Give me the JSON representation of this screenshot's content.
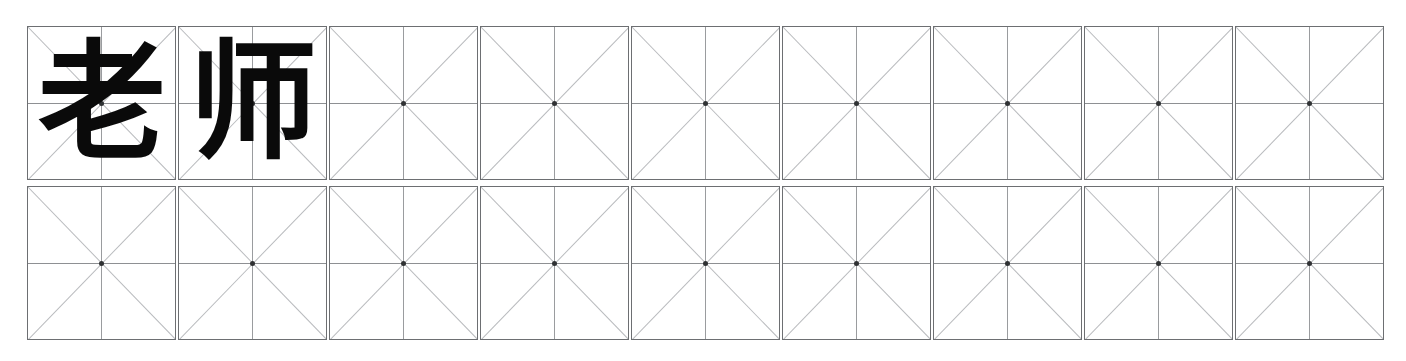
{
  "worksheet": {
    "title": "Chinese character handwriting practice sheet",
    "grid_style": "mi-zi-ge",
    "rows": 2,
    "columns": 9,
    "colors": {
      "page_background": "#ffffff",
      "cell_background": "#ffffff",
      "cell_border": "#6d6f72",
      "center_line": "#8e9093",
      "diagonal_line": "#b9bbbe",
      "center_dot": "#2f3133",
      "glyph": "#0a0a0a"
    },
    "grid": [
      {
        "row_index": 0,
        "cells": [
          {
            "index": 0,
            "character": "老",
            "filled": true
          },
          {
            "index": 1,
            "character": "师",
            "filled": true
          },
          {
            "index": 2,
            "character": "",
            "filled": false
          },
          {
            "index": 3,
            "character": "",
            "filled": false
          },
          {
            "index": 4,
            "character": "",
            "filled": false
          },
          {
            "index": 5,
            "character": "",
            "filled": false
          },
          {
            "index": 6,
            "character": "",
            "filled": false
          },
          {
            "index": 7,
            "character": "",
            "filled": false
          },
          {
            "index": 8,
            "character": "",
            "filled": false
          }
        ]
      },
      {
        "row_index": 1,
        "cells": [
          {
            "index": 0,
            "character": "",
            "filled": false
          },
          {
            "index": 1,
            "character": "",
            "filled": false
          },
          {
            "index": 2,
            "character": "",
            "filled": false
          },
          {
            "index": 3,
            "character": "",
            "filled": false
          },
          {
            "index": 4,
            "character": "",
            "filled": false
          },
          {
            "index": 5,
            "character": "",
            "filled": false
          },
          {
            "index": 6,
            "character": "",
            "filled": false
          },
          {
            "index": 7,
            "character": "",
            "filled": false
          },
          {
            "index": 8,
            "character": "",
            "filled": false
          }
        ]
      }
    ]
  }
}
